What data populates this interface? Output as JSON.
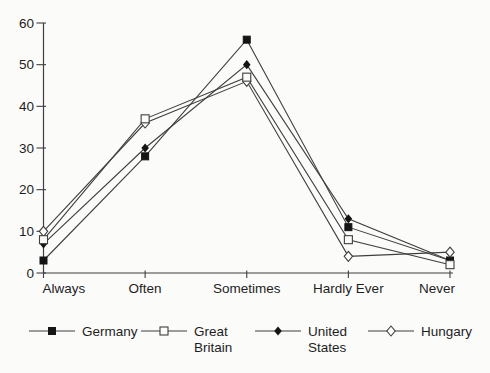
{
  "chart_data": {
    "type": "line",
    "title": "",
    "xlabel": "",
    "ylabel": "",
    "categories": [
      "Always",
      "Often",
      "Sometimes",
      "Hardly Ever",
      "Never"
    ],
    "series": [
      {
        "name": "Germany",
        "marker": "square-filled",
        "values": [
          3,
          28,
          56,
          11,
          3
        ]
      },
      {
        "name": "Great Britain",
        "marker": "square-open",
        "values": [
          8,
          37,
          47,
          8,
          2
        ]
      },
      {
        "name": "United States",
        "marker": "diamond-filled",
        "values": [
          7,
          30,
          50,
          13,
          3
        ]
      },
      {
        "name": "Hungary",
        "marker": "diamond-open",
        "values": [
          10,
          36,
          46,
          4,
          5
        ]
      }
    ],
    "ylim": [
      0,
      60
    ],
    "yticks": [
      0,
      10,
      20,
      30,
      40,
      50,
      60
    ],
    "grid": false,
    "legend_position": "bottom",
    "legend": [
      {
        "label": "Germany",
        "label2": ""
      },
      {
        "label": "Great",
        "label2": "Britain"
      },
      {
        "label": "United",
        "label2": "States"
      },
      {
        "label": "Hungary",
        "label2": ""
      }
    ],
    "line_color": "#3f3f3f",
    "marker_fill_color": "#141414",
    "marker_open_color": "#fbfbfa"
  }
}
